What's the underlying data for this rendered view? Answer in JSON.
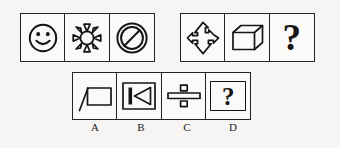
{
  "puzzle": {
    "type": "non-verbal-reasoning-analogy",
    "background_color": "#f6f5f3",
    "ink_color": "#161616",
    "question_row": {
      "left_group": {
        "name": "figure-set-1",
        "cells": [
          {
            "index": 1,
            "icon": "smiley-face-icon",
            "description": "circle with two eyes and a smile"
          },
          {
            "index": 2,
            "icon": "sun-icon",
            "description": "circle with eight triangular rays"
          },
          {
            "index": 3,
            "icon": "prohibition-sign-icon",
            "description": "double circle with diagonal slash"
          }
        ]
      },
      "right_group": {
        "name": "figure-set-2",
        "cells": [
          {
            "index": 1,
            "icon": "four-way-move-arrow-icon",
            "description": "cross shaped arrow pointing four directions"
          },
          {
            "index": 2,
            "icon": "cube-icon",
            "description": "three dimensional wireframe cube"
          },
          {
            "index": 3,
            "icon": "question-mark-icon",
            "description": "large question mark placeholder",
            "glyph": "?"
          }
        ]
      }
    },
    "options_row": {
      "name": "answer-options",
      "options": [
        {
          "label": "A",
          "icon": "flag-rectangle-icon",
          "description": "rectangle with diagonal pole line at left"
        },
        {
          "label": "B",
          "icon": "skip-back-icon",
          "description": "vertical bar with left pointing triangle inside a frame"
        },
        {
          "label": "C",
          "icon": "division-sign-icon",
          "description": "horizontal bar with a dot above and below"
        },
        {
          "label": "D",
          "icon": "question-mark-framed-icon",
          "description": "question mark inside a rectangular frame",
          "glyph": "?"
        }
      ]
    }
  }
}
